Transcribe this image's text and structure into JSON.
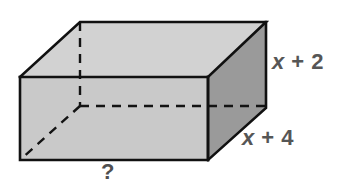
{
  "figure": {
    "kind": "rectangular-prism-diagram",
    "background_color": "#ffffff",
    "outline_color": "#111111",
    "faces": {
      "top_face_color": "#d2d2d2",
      "front_face_color": "#c9c9c9",
      "right_face_color": "#9a9a9a"
    },
    "hidden_edges_style": "dashed"
  },
  "labels": {
    "height": {
      "variable": "x",
      "operator": "+",
      "constant": "2",
      "full_text": "x + 2",
      "color": "#565656"
    },
    "depth": {
      "variable": "x",
      "operator": "+",
      "constant": "4",
      "full_text": "x + 4",
      "color": "#565656"
    },
    "width": {
      "full_text": "?",
      "color": "#4f4f4f"
    }
  },
  "geometry": {
    "front_top_left": [
      20,
      77
    ],
    "front_top_right": [
      208,
      77
    ],
    "front_bottom_left": [
      20,
      160
    ],
    "front_bottom_right": [
      208,
      160
    ],
    "back_top_left": [
      80,
      22
    ],
    "back_top_right": [
      266,
      22
    ],
    "back_bottom_right": [
      266,
      108
    ],
    "back_bottom_left_hidden": [
      80,
      106
    ]
  }
}
